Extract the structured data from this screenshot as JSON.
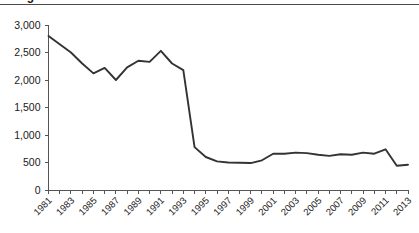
{
  "figure": {
    "title_fragment": "Figure",
    "top_rule_color": "#4a4a4a",
    "background_color": "#ffffff"
  },
  "chart_data": {
    "type": "line",
    "title": "",
    "xlabel": "",
    "ylabel": "",
    "xlim": [
      1981,
      2013
    ],
    "ylim": [
      0,
      3000
    ],
    "grid": false,
    "legend": "none",
    "line_color": "#333333",
    "axis_color": "#555555",
    "y_ticks": [
      0,
      500,
      1000,
      1500,
      2000,
      2500,
      3000
    ],
    "y_tick_labels": [
      "0",
      "500",
      "1,000",
      "1,500",
      "2,000",
      "2,500",
      "3,000"
    ],
    "x_ticks": [
      1981,
      1982,
      1983,
      1984,
      1985,
      1986,
      1987,
      1988,
      1989,
      1990,
      1991,
      1992,
      1993,
      1994,
      1995,
      1996,
      1997,
      1998,
      1999,
      2000,
      2001,
      2002,
      2003,
      2004,
      2005,
      2006,
      2007,
      2008,
      2009,
      2010,
      2011,
      2012,
      2013
    ],
    "x_tick_labels": [
      "1981",
      "1983",
      "1985",
      "1987",
      "1989",
      "1991",
      "1993",
      "1995",
      "1997",
      "1999",
      "2001",
      "2003",
      "2005",
      "2007",
      "2009",
      "2011",
      "2013"
    ],
    "x_label_step": 2,
    "x_label_rotation": -45,
    "x": [
      1981,
      1982,
      1983,
      1984,
      1985,
      1986,
      1987,
      1988,
      1989,
      1990,
      1991,
      1992,
      1993,
      1994,
      1995,
      1996,
      1997,
      1998,
      1999,
      2000,
      2001,
      2002,
      2003,
      2004,
      2005,
      2006,
      2007,
      2008,
      2009,
      2010,
      2011,
      2012,
      2013
    ],
    "values": [
      2800,
      2650,
      2500,
      2300,
      2120,
      2220,
      2000,
      2230,
      2350,
      2330,
      2530,
      2300,
      2180,
      780,
      600,
      520,
      500,
      495,
      490,
      540,
      660,
      660,
      680,
      670,
      640,
      620,
      650,
      640,
      680,
      660,
      740,
      440,
      460
    ]
  }
}
